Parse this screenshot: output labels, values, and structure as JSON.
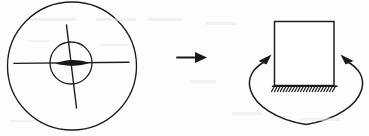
{
  "figure": {
    "background_color": "#fdfdfd",
    "ink_color": "#1c1c1c",
    "width": 369,
    "height": 136,
    "panels": [
      {
        "id": "left-panel",
        "name": "crosshair-target-panel",
        "description": "Concentric circles with crosshair axes and a dark lens-shaped core",
        "outer_circle": {
          "cx": 72,
          "cy": 66,
          "r": 64
        },
        "inner_circle": {
          "cx": 71,
          "cy": 63,
          "r": 21
        },
        "horizontal_axis": {
          "x1": 14,
          "y1": 63,
          "x2": 129,
          "y2": 62
        },
        "vertical_axis": {
          "x1": 67,
          "y1": 25,
          "x2": 76,
          "y2": 108
        },
        "core_lens": {
          "cx": 72,
          "cy": 63,
          "rx": 17,
          "ry": 3
        }
      },
      {
        "id": "center-panel",
        "name": "transition-arrow-panel",
        "description": "Straight arrow pointing right indicating transformation",
        "arrow": {
          "x1": 177,
          "y1": 57,
          "x2": 207,
          "y2": 57,
          "head_length": 11,
          "head_half_width": 5
        }
      },
      {
        "id": "right-panel",
        "name": "fixed-block-rotation-panel",
        "description": "Rectangular block fixed to hatched ground with a curved loop arrow around it",
        "block": {
          "x": 274,
          "y": 21,
          "width": 60,
          "height": 64
        },
        "ground_hatch": {
          "x1": 273,
          "y1": 86,
          "x2": 337,
          "y2": 86,
          "tick_count": 22,
          "tick_length": 6,
          "tick_angle_deg": 60
        },
        "loop_ellipse": {
          "cx": 306,
          "cy": 91,
          "rx": 56,
          "ry": 34
        },
        "arrowheads": [
          {
            "name": "left-arrowhead",
            "x": 262,
            "y": 58,
            "direction": "up-right"
          },
          {
            "name": "right-arrowhead",
            "x": 350,
            "y": 58,
            "direction": "up-left"
          }
        ]
      }
    ],
    "labels": {
      "left_panel_label": "",
      "center_panel_label": "",
      "right_panel_label": ""
    }
  }
}
